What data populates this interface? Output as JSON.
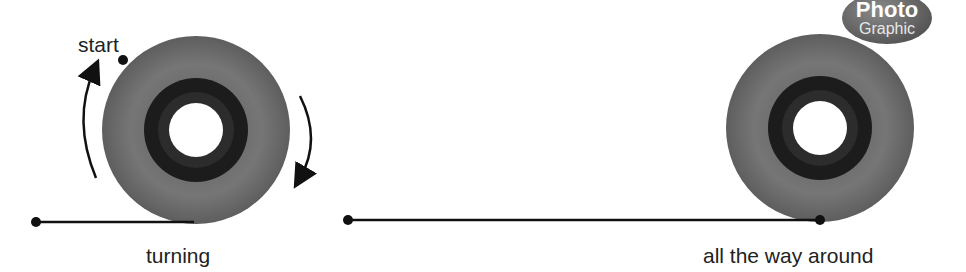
{
  "labels": {
    "start": "start",
    "turning": "turning",
    "all_the_way_around": "all the way around"
  },
  "badge": {
    "line1": "Photo",
    "line2": "Graphic"
  },
  "colors": {
    "wheel_tire": "#6e6e6e",
    "wheel_hub": "#1c1c1c",
    "line": "#111111"
  },
  "figures": [
    {
      "name": "wheel-turning",
      "center": [
        196,
        130
      ],
      "radius": 94,
      "caption": "turning"
    },
    {
      "name": "wheel-full-turn",
      "center": [
        820,
        128
      ],
      "radius": 94,
      "caption": "all the way around"
    }
  ]
}
